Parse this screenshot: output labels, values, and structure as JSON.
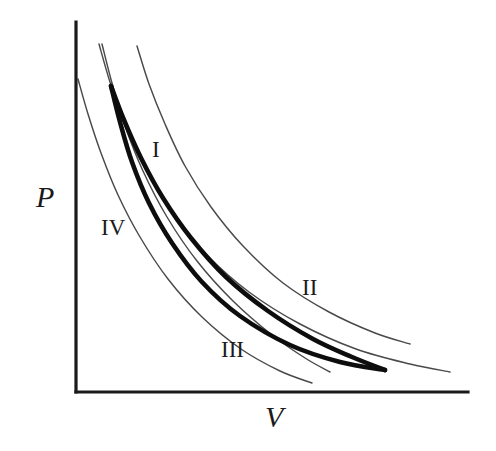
{
  "figure": {
    "kind": "pressure-volume-diagram",
    "background_color": "#ffffff",
    "width": 496,
    "height": 451
  },
  "axes": {
    "y_axis_label": "P",
    "x_axis_label": "V",
    "axis_color": "#1a1a1a",
    "origin": [
      76,
      392
    ],
    "y_axis_top": [
      76,
      22
    ],
    "x_axis_right": [
      468,
      392
    ]
  },
  "curve_labels": [
    {
      "text": "I",
      "x": 152,
      "y": 138
    },
    {
      "text": "II",
      "x": 302,
      "y": 276
    },
    {
      "text": "III",
      "x": 221,
      "y": 338
    },
    {
      "text": "IV",
      "x": 101,
      "y": 216
    }
  ],
  "chart_data": {
    "type": "line",
    "title": "",
    "xlabel": "V",
    "ylabel": "P",
    "grid": false,
    "legend": "none",
    "axis_ranges": {
      "x": [
        76,
        468
      ],
      "y": [
        392,
        22
      ]
    },
    "series": [
      {
        "name": "thick-upper-process",
        "style": "thick",
        "color": "#0d0d0d",
        "points": [
          [
            111,
            86
          ],
          [
            124,
            120
          ],
          [
            141,
            158
          ],
          [
            163,
            198
          ],
          [
            191,
            238
          ],
          [
            226,
            277
          ],
          [
            268,
            311
          ],
          [
            313,
            339
          ],
          [
            352,
            357
          ],
          [
            385,
            370
          ]
        ]
      },
      {
        "name": "thick-lower-process",
        "style": "thick",
        "color": "#0d0d0d",
        "points": [
          [
            111,
            86
          ],
          [
            120,
            122
          ],
          [
            132,
            162
          ],
          [
            149,
            203
          ],
          [
            172,
            243
          ],
          [
            202,
            282
          ],
          [
            240,
            316
          ],
          [
            290,
            345
          ],
          [
            340,
            362
          ],
          [
            385,
            370
          ]
        ]
      },
      {
        "name": "curve-I",
        "label": "I",
        "style": "thin",
        "color": "#4a4a4a",
        "points": [
          [
            137,
            46
          ],
          [
            149,
            84
          ],
          [
            165,
            124
          ],
          [
            185,
            166
          ],
          [
            211,
            207
          ],
          [
            243,
            246
          ],
          [
            283,
            283
          ],
          [
            329,
            312
          ],
          [
            375,
            333
          ],
          [
            410,
            344
          ]
        ]
      },
      {
        "name": "curve-II",
        "label": "II",
        "style": "thin",
        "color": "#4a4a4a",
        "points": [
          [
            99,
            44
          ],
          [
            110,
            82
          ],
          [
            125,
            124
          ],
          [
            145,
            168
          ],
          [
            172,
            212
          ],
          [
            206,
            254
          ],
          [
            249,
            292
          ],
          [
            300,
            324
          ],
          [
            356,
            349
          ],
          [
            410,
            364
          ],
          [
            450,
            372
          ]
        ]
      },
      {
        "name": "curve-III",
        "label": "III",
        "style": "thin",
        "color": "#4a4a4a",
        "points": [
          [
            102,
            44
          ],
          [
            112,
            83
          ],
          [
            125,
            126
          ],
          [
            143,
            171
          ],
          [
            167,
            217
          ],
          [
            197,
            261
          ],
          [
            233,
            301
          ],
          [
            272,
            335
          ],
          [
            305,
            358
          ],
          [
            330,
            372
          ]
        ]
      },
      {
        "name": "curve-IV",
        "label": "IV",
        "style": "thin",
        "color": "#4a4a4a",
        "points": [
          [
            78,
            79
          ],
          [
            88,
            114
          ],
          [
            101,
            153
          ],
          [
            118,
            195
          ],
          [
            140,
            237
          ],
          [
            168,
            279
          ],
          [
            202,
            317
          ],
          [
            241,
            349
          ],
          [
            280,
            371
          ],
          [
            312,
            383
          ]
        ]
      }
    ]
  }
}
